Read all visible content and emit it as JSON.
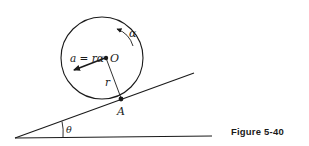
{
  "figure": {
    "caption": "Figure 5-40",
    "labels": {
      "center": "O",
      "contact_point": "A",
      "radius": "r",
      "angular_acceleration": "α",
      "acceleration": "a = rα",
      "incline_angle": "θ"
    },
    "colors": {
      "ink": "#1a1a1a",
      "background": "#ffffff"
    }
  }
}
